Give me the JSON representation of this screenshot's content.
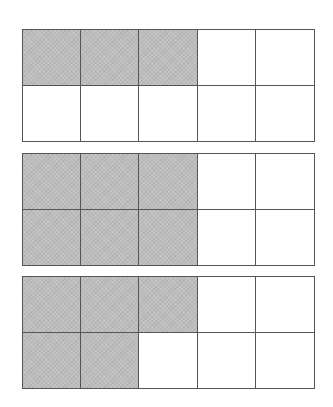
{
  "diagram": {
    "shade_color": "#bdbdbd",
    "line_color": "#555555",
    "grids": [
      {
        "rows": 2,
        "cols": 5,
        "shaded_count": 3,
        "total": 10,
        "cells": [
          [
            true,
            true,
            true,
            false,
            false
          ],
          [
            false,
            false,
            false,
            false,
            false
          ]
        ]
      },
      {
        "rows": 2,
        "cols": 5,
        "shaded_count": 6,
        "total": 10,
        "cells": [
          [
            true,
            true,
            true,
            false,
            false
          ],
          [
            true,
            true,
            true,
            false,
            false
          ]
        ]
      },
      {
        "rows": 2,
        "cols": 5,
        "shaded_count": 5,
        "total": 10,
        "cells": [
          [
            true,
            true,
            true,
            false,
            false
          ],
          [
            true,
            true,
            false,
            false,
            false
          ]
        ]
      }
    ]
  }
}
